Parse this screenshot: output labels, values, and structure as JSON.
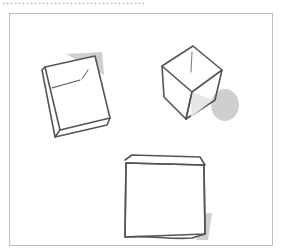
{
  "caption": "………………………………",
  "figure": {
    "cubes": [
      {
        "name": "tilted-cube-left",
        "position": "top-left"
      },
      {
        "name": "isometric-cube-right",
        "position": "top-right"
      },
      {
        "name": "front-cube-bottom",
        "position": "bottom-center"
      }
    ],
    "colors": {
      "stroke": "#555555",
      "shadow": "#c8c8c8",
      "border": "#bdbdbd"
    }
  }
}
